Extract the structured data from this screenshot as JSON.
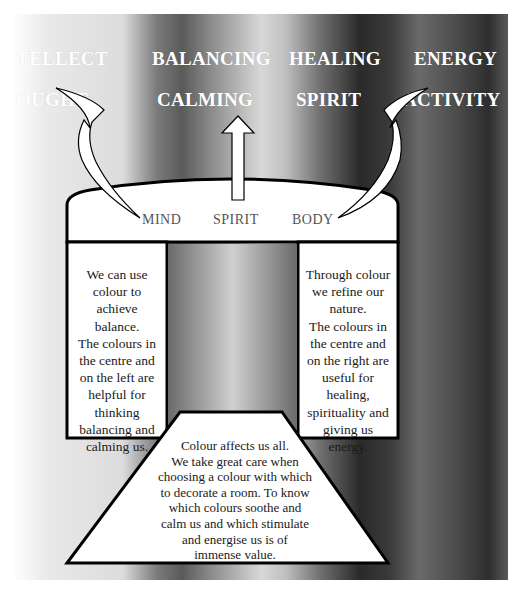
{
  "top_labels": {
    "row1": [
      "TELLECT",
      "BALANCING",
      "HEALING",
      "ENERGY"
    ],
    "row2": [
      "OUGHT",
      "CALMING",
      "SPIRIT",
      "ACTIVITY"
    ]
  },
  "arch": {
    "labels": [
      "MIND",
      "SPIRIT",
      "BODY"
    ]
  },
  "left_box": {
    "lines": [
      "We can use",
      "colour to",
      "achieve",
      "balance.",
      "The colours in",
      "the centre and",
      "on the left are",
      "helpful for",
      "thinking",
      "balancing and",
      "calming us."
    ]
  },
  "right_box": {
    "lines": [
      "Through colour",
      "we refine our",
      "nature.",
      "The colours in",
      "the centre and",
      "on the right are",
      "useful for",
      "healing,",
      "spirituality and",
      "giving us",
      "energy."
    ]
  },
  "trapezoid": {
    "lines": [
      "Colour affects us all.",
      "We take great care when",
      "choosing a colour with which",
      "to decorate a room.  To know",
      "which colours soothe and",
      "calm us and which stimulate",
      "and energise us is of",
      "immense value."
    ]
  },
  "colors": {
    "outline": "#000000",
    "fill": "#ffffff",
    "label_text": "#ffffff",
    "arch_text": "#555555"
  }
}
